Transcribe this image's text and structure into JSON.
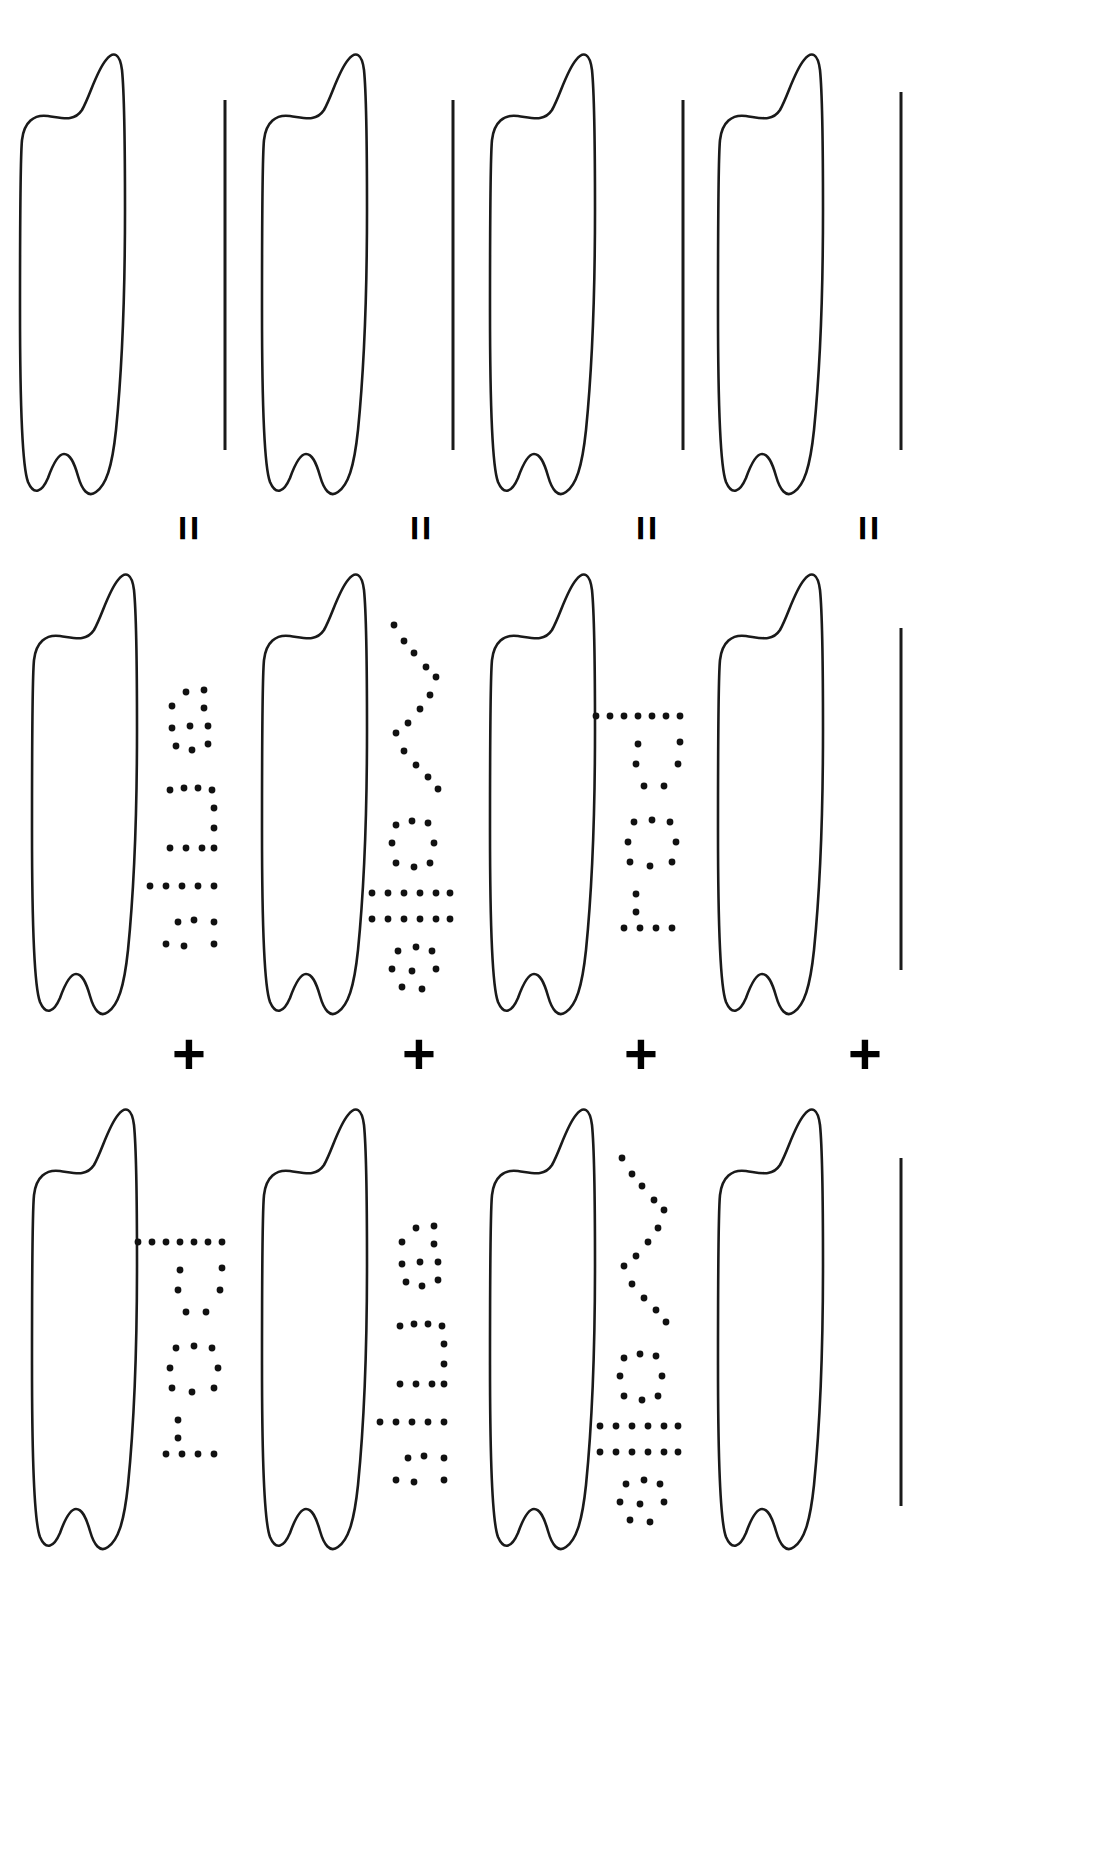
{
  "figure": {
    "type": "diagram",
    "background_color": "#ffffff",
    "ink_color": "#1a1a1a",
    "columns": 4,
    "rows": 3
  },
  "operators": {
    "equals_glyph": "=",
    "plus_glyph": "+",
    "equals_row": [
      "=",
      "=",
      "=",
      "="
    ],
    "plus_row": [
      "+",
      "+",
      "+",
      "+"
    ]
  },
  "rows": [
    {
      "name": "row-top",
      "cells": [
        {
          "shape": "blade-outline",
          "label": null,
          "rule": true
        },
        {
          "shape": "blade-outline",
          "label": null,
          "rule": true
        },
        {
          "shape": "blade-outline",
          "label": null,
          "rule": true
        },
        {
          "shape": "blade-outline",
          "label": null,
          "rule": true
        }
      ]
    },
    {
      "name": "row-middle",
      "cells": [
        {
          "shape": "blade-outline",
          "label": "enF",
          "rule": false
        },
        {
          "shape": "blade-outline",
          "label": "=Ao",
          "rule": false
        },
        {
          "shape": "blade-outline",
          "label": "Lot",
          "rule": false
        },
        {
          "shape": "blade-outline",
          "label": null,
          "rule": true
        }
      ]
    },
    {
      "name": "row-bottom",
      "cells": [
        {
          "shape": "blade-outline",
          "label": "Lot",
          "rule": false
        },
        {
          "shape": "blade-outline",
          "label": "enF",
          "rule": false
        },
        {
          "shape": "blade-outline",
          "label": "=Ao",
          "rule": false
        },
        {
          "shape": "blade-outline",
          "label": null,
          "rule": true
        }
      ]
    }
  ],
  "dotted_labels": {
    "style": "dotted stencil, rotated 90 degrees counter-clockwise",
    "variants": [
      "enF",
      "=Ao",
      "Lot"
    ]
  }
}
